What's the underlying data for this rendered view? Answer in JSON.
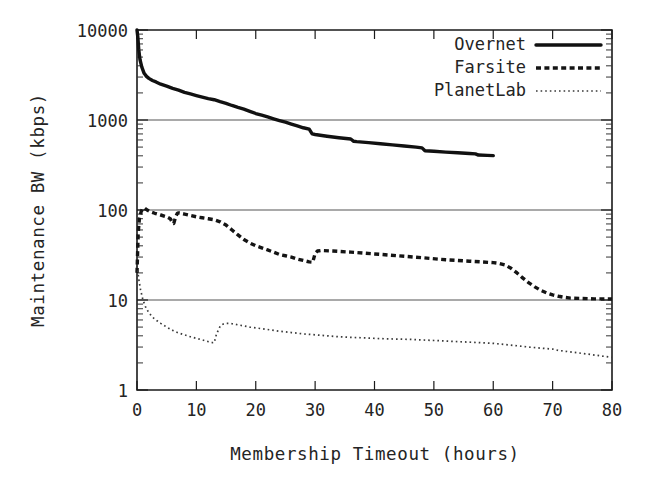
{
  "chart_data": {
    "type": "line",
    "title": "",
    "xlabel": "Membership Timeout (hours)",
    "ylabel": "Maintenance BW (kbps)",
    "xlim": [
      0,
      80
    ],
    "ylim": [
      1,
      10000
    ],
    "yscale": "log",
    "xscale": "linear",
    "grid": true,
    "gridlines_y": [
      10,
      100,
      1000
    ],
    "xticks": [
      0,
      10,
      20,
      30,
      40,
      50,
      60,
      70,
      80
    ],
    "xticklabels": [
      "0",
      "10",
      "20",
      "30",
      "40",
      "50",
      "60",
      "70",
      "80"
    ],
    "yticks": [
      1,
      10,
      100,
      1000,
      10000
    ],
    "yticklabels": [
      "1",
      "10",
      "100",
      "1000",
      "10000"
    ],
    "legend_position": "top-right",
    "series": [
      {
        "name": "Overnet",
        "style": "solid-thick",
        "color": "#111111",
        "x": [
          0.0,
          0.15,
          0.3,
          0.5,
          0.8,
          1.2,
          1.6,
          2.0,
          2.6,
          3.2,
          4.0,
          5.0,
          6.0,
          7.0,
          8.0,
          9.0,
          10.0,
          11.0,
          12.0,
          13.0,
          14.0,
          15.0,
          16.0,
          17.0,
          18.0,
          19.0,
          20.0,
          21.0,
          22.0,
          23.0,
          24.0,
          25.0,
          26.0,
          27.0,
          28.0,
          29.0,
          29.5,
          30.0,
          32.0,
          34.0,
          36.0,
          36.5,
          37.0,
          39.0,
          41.0,
          43.0,
          45.0,
          47.0,
          48.0,
          48.5,
          50.0,
          52.0,
          54.0,
          56.0,
          57.0,
          57.5,
          59.0,
          60.0
        ],
        "y": [
          10000,
          8200,
          6000,
          4700,
          3900,
          3300,
          3050,
          2900,
          2750,
          2650,
          2500,
          2380,
          2250,
          2150,
          2030,
          1950,
          1870,
          1800,
          1730,
          1680,
          1600,
          1530,
          1450,
          1380,
          1320,
          1250,
          1180,
          1130,
          1080,
          1030,
          985,
          945,
          900,
          860,
          820,
          790,
          700,
          690,
          660,
          635,
          615,
          580,
          575,
          560,
          545,
          530,
          515,
          500,
          490,
          455,
          450,
          440,
          432,
          425,
          420,
          408,
          405,
          402
        ]
      },
      {
        "name": "Farsite",
        "style": "dashed-thick",
        "color": "#141414",
        "x": [
          0.0,
          0.2,
          0.4,
          0.7,
          1.0,
          1.3,
          1.7,
          2.2,
          3.0,
          4.0,
          5.0,
          5.6,
          6.0,
          6.2,
          6.5,
          6.8,
          7.0,
          7.4,
          8.0,
          9.0,
          10.0,
          11.0,
          12.0,
          13.0,
          14.0,
          15.0,
          16.0,
          17.0,
          18.0,
          19.0,
          20.0,
          21.0,
          22.0,
          23.0,
          24.0,
          25.0,
          26.0,
          27.0,
          28.0,
          29.0,
          29.6,
          30.0,
          30.4,
          31.0,
          33.0,
          36.0,
          40.0,
          44.0,
          48.0,
          52.0,
          56.0,
          58.0,
          60.0,
          61.0,
          62.0,
          63.0,
          64.0,
          65.0,
          66.0,
          67.0,
          68.0,
          69.0,
          70.0,
          71.0,
          72.0,
          73.0,
          75.0,
          77.0,
          80.0
        ],
        "y": [
          20,
          55,
          80,
          96,
          104,
          105,
          100,
          96,
          92,
          88,
          84,
          80,
          72,
          71,
          84,
          92,
          93,
          92,
          90,
          87,
          84,
          82,
          80,
          78,
          74,
          68,
          60,
          53,
          47,
          43,
          40,
          38,
          36,
          34,
          32,
          31,
          30,
          28.5,
          27.5,
          26.5,
          26.3,
          33,
          35,
          35.5,
          35,
          34,
          32.5,
          31,
          29.5,
          28,
          27,
          26.5,
          26,
          25.5,
          24.5,
          22.5,
          20,
          17.5,
          15.5,
          14,
          12.8,
          12,
          11.4,
          11,
          10.7,
          10.5,
          10.4,
          10.3,
          10.3
        ]
      },
      {
        "name": "PlanetLab",
        "style": "dotted-thin",
        "color": "#3a3a3a",
        "x": [
          0.0,
          0.3,
          0.6,
          1.0,
          1.5,
          2.0,
          2.5,
          3.0,
          3.5,
          4.0,
          5.0,
          6.0,
          7.0,
          8.0,
          9.0,
          10.0,
          11.0,
          12.0,
          12.8,
          13.0,
          13.4,
          14.0,
          14.5,
          15.0,
          15.5,
          16.0,
          17.0,
          18.0,
          19.0,
          20.0,
          22.0,
          24.0,
          26.0,
          28.0,
          30.0,
          32.0,
          34.0,
          36.0,
          38.0,
          40.0,
          42.0,
          44.0,
          46.0,
          48.0,
          50.0,
          52.0,
          54.0,
          56.0,
          58.0,
          60.0,
          62.0,
          64.0,
          66.0,
          68.0,
          69.0,
          70.0,
          71.0,
          72.0,
          74.0,
          76.0,
          78.0,
          80.0
        ],
        "y": [
          24,
          17,
          13,
          10.0,
          8.2,
          7.2,
          6.6,
          6.1,
          5.8,
          5.5,
          5.0,
          4.6,
          4.3,
          4.1,
          3.9,
          3.75,
          3.6,
          3.45,
          3.35,
          3.35,
          4.2,
          5.1,
          5.4,
          5.5,
          5.5,
          5.45,
          5.3,
          5.15,
          5.0,
          4.9,
          4.7,
          4.5,
          4.35,
          4.2,
          4.1,
          4.0,
          3.9,
          3.85,
          3.8,
          3.75,
          3.7,
          3.68,
          3.65,
          3.6,
          3.55,
          3.5,
          3.45,
          3.4,
          3.35,
          3.3,
          3.2,
          3.1,
          3.0,
          2.92,
          2.88,
          2.85,
          2.75,
          2.7,
          2.6,
          2.5,
          2.4,
          2.3
        ]
      }
    ]
  },
  "axes": {
    "y_title": "Maintenance BW (kbps)",
    "x_title": "Membership Timeout (hours)",
    "y_labels": [
      "10000",
      "1000",
      "100",
      "10",
      "1"
    ],
    "x_labels": [
      "0",
      "10",
      "20",
      "30",
      "40",
      "50",
      "60",
      "70",
      "80"
    ]
  },
  "legend": {
    "entries": [
      {
        "label": "Overnet",
        "style": "solid"
      },
      {
        "label": "Farsite",
        "style": "dashed"
      },
      {
        "label": "PlanetLab",
        "style": "dotted"
      }
    ]
  },
  "colors": {
    "background": "#ffffff",
    "axis": "#1a1a1a",
    "grid": "#555555",
    "text": "#242424",
    "overnet": "#111111",
    "farsite": "#141414",
    "planetlab": "#3a3a3a"
  }
}
